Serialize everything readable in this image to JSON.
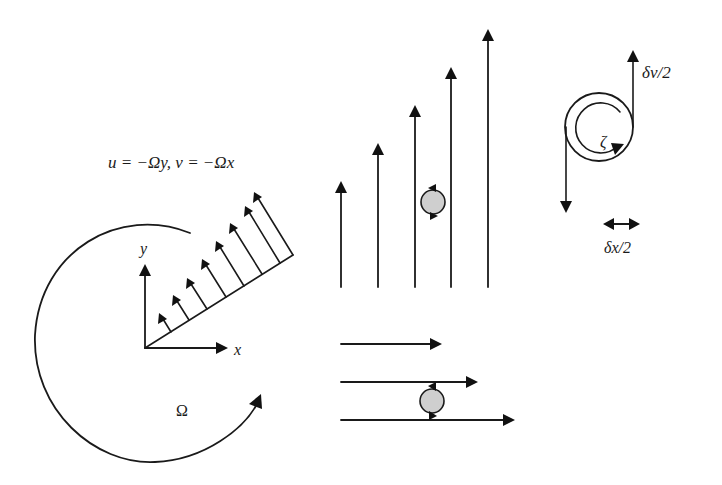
{
  "diagram": {
    "panels": {
      "solid_body_rotation": {
        "equation": "u = −Ωy, v = −Ωx",
        "axis_x_label": "x",
        "axis_y_label": "y",
        "rotation_label": "Ω",
        "velocity_arrow_count": 8
      },
      "vertical_shear": {
        "arrow_count": 5,
        "arrow_direction": "up",
        "arrow_heights_relative": [
          1,
          2,
          3,
          4,
          5
        ],
        "has_vortex_marker": true
      },
      "horizontal_shear": {
        "arrow_count": 3,
        "arrow_direction": "right",
        "arrow_lengths_relative": [
          1,
          1.3,
          1.6
        ],
        "has_vortex_marker": true
      },
      "vortex_element": {
        "velocity_label": "δv/2",
        "distance_label": "δx/2",
        "vorticity_label": "ζ"
      }
    },
    "colors": {
      "line": "#1a1a1a",
      "vortex_fill": "#cfcfcf",
      "background": "#ffffff"
    }
  }
}
